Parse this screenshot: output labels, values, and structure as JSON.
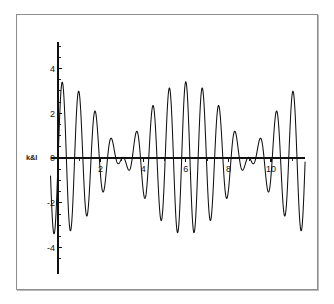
{
  "figure": {
    "background_color": "#ffffff",
    "frame_color": "#8d8d8d",
    "curve_color": "#101010",
    "axis_color": "#111111",
    "y_axis_label": "k&l"
  },
  "chart_data": {
    "type": "line",
    "title": "",
    "subtitle": "",
    "xlabel": "",
    "ylabel": "k&l",
    "xlim": [
      -0.35,
      11.6
    ],
    "ylim": [
      -5.2,
      5.2
    ],
    "grid": false,
    "legend": null,
    "x_ticks_major": [
      2,
      4,
      6,
      8,
      10
    ],
    "x_tick_labels": [
      "2",
      "4",
      "6",
      "8",
      "10"
    ],
    "x_ticks_minor": [
      1,
      3,
      5,
      7,
      9,
      11
    ],
    "y_ticks_major": [
      -4,
      -2,
      0,
      2,
      4
    ],
    "y_tick_labels": [
      "-4",
      "-2",
      "0",
      "2",
      "4"
    ],
    "y_ticks_minor": [
      -4.5,
      -3.5,
      -3,
      -2.5,
      -1.5,
      -1,
      -0.5,
      0.5,
      1,
      1.5,
      2.5,
      3,
      3.5,
      4.5,
      5
    ],
    "formula": "y = cos(7.6*x) + cos(8.65*x)",
    "series": [
      {
        "name": "beat",
        "component_amplitudes": [
          1,
          1
        ],
        "component_frequencies": [
          7.6,
          8.65
        ],
        "peak_x": 6.0,
        "peak_y": 3.4,
        "side_peak_y": 2.2,
        "baseline_envelope": 1.0,
        "x_start": -0.35,
        "x_end": 11.6,
        "samples": 2600
      }
    ]
  }
}
